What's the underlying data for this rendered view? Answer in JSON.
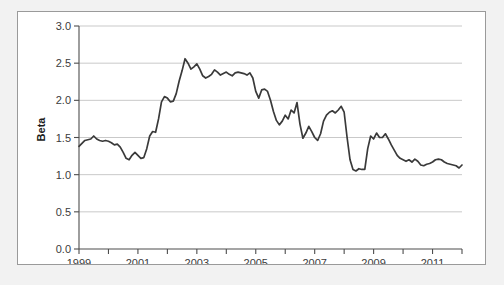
{
  "chart_data": {
    "type": "line",
    "title": "",
    "xlabel": "",
    "ylabel": "Beta",
    "xlim": [
      1999,
      2012
    ],
    "ylim": [
      0.0,
      3.0
    ],
    "grid": true,
    "legend": null,
    "ytick_labels": [
      "0.0",
      "0.5",
      "1.0",
      "1.5",
      "2.0",
      "2.5",
      "3.0"
    ],
    "ytick_values": [
      0.0,
      0.5,
      1.0,
      1.5,
      2.0,
      2.5,
      3.0
    ],
    "xtick_labels": [
      "1999",
      "2001",
      "2003",
      "2005",
      "2007",
      "2009",
      "2011"
    ],
    "xtick_values": [
      1999,
      2001,
      2003,
      2005,
      2007,
      2009,
      2011
    ],
    "xminor_ticks": [
      2000,
      2002,
      2004,
      2006,
      2008,
      2010,
      2012
    ],
    "line_color": "#3a3a3a",
    "series": [
      {
        "name": "Beta",
        "x": [
          1999.0,
          1999.1,
          1999.2,
          1999.3,
          1999.4,
          1999.5,
          1999.6,
          1999.7,
          1999.8,
          1999.9,
          2000.0,
          2000.1,
          2000.2,
          2000.3,
          2000.4,
          2000.5,
          2000.6,
          2000.7,
          2000.8,
          2000.9,
          2001.0,
          2001.1,
          2001.2,
          2001.3,
          2001.4,
          2001.5,
          2001.6,
          2001.7,
          2001.8,
          2001.9,
          2002.0,
          2002.1,
          2002.2,
          2002.3,
          2002.4,
          2002.5,
          2002.6,
          2002.7,
          2002.8,
          2002.9,
          2003.0,
          2003.1,
          2003.2,
          2003.3,
          2003.4,
          2003.5,
          2003.6,
          2003.7,
          2003.8,
          2003.9,
          2004.0,
          2004.1,
          2004.2,
          2004.3,
          2004.4,
          2004.5,
          2004.6,
          2004.7,
          2004.8,
          2004.9,
          2005.0,
          2005.1,
          2005.2,
          2005.3,
          2005.4,
          2005.5,
          2005.6,
          2005.7,
          2005.8,
          2005.9,
          2006.0,
          2006.1,
          2006.2,
          2006.3,
          2006.4,
          2006.5,
          2006.6,
          2006.7,
          2006.8,
          2006.9,
          2007.0,
          2007.1,
          2007.2,
          2007.3,
          2007.4,
          2007.5,
          2007.6,
          2007.7,
          2007.8,
          2007.9,
          2008.0,
          2008.1,
          2008.2,
          2008.3,
          2008.4,
          2008.5,
          2008.6,
          2008.7,
          2008.8,
          2008.9,
          2009.0,
          2009.1,
          2009.2,
          2009.3,
          2009.4,
          2009.5,
          2009.6,
          2009.7,
          2009.8,
          2009.9,
          2010.0,
          2010.1,
          2010.2,
          2010.3,
          2010.4,
          2010.5,
          2010.6,
          2010.7,
          2010.8,
          2010.9,
          2011.0,
          2011.1,
          2011.2,
          2011.3,
          2011.4,
          2011.5,
          2011.6,
          2011.7,
          2011.8,
          2011.9,
          2012.0
        ],
        "y": [
          1.38,
          1.42,
          1.46,
          1.47,
          1.48,
          1.52,
          1.48,
          1.46,
          1.45,
          1.46,
          1.45,
          1.43,
          1.4,
          1.41,
          1.37,
          1.3,
          1.22,
          1.2,
          1.26,
          1.3,
          1.26,
          1.22,
          1.23,
          1.35,
          1.52,
          1.58,
          1.57,
          1.75,
          1.98,
          2.05,
          2.03,
          1.98,
          1.99,
          2.09,
          2.26,
          2.4,
          2.56,
          2.5,
          2.42,
          2.45,
          2.49,
          2.42,
          2.33,
          2.3,
          2.32,
          2.35,
          2.41,
          2.38,
          2.34,
          2.36,
          2.38,
          2.35,
          2.33,
          2.37,
          2.38,
          2.37,
          2.36,
          2.34,
          2.37,
          2.3,
          2.12,
          2.03,
          2.14,
          2.15,
          2.12,
          2.0,
          1.85,
          1.73,
          1.67,
          1.72,
          1.8,
          1.75,
          1.87,
          1.83,
          1.97,
          1.68,
          1.49,
          1.56,
          1.65,
          1.58,
          1.5,
          1.46,
          1.55,
          1.72,
          1.8,
          1.84,
          1.86,
          1.83,
          1.87,
          1.92,
          1.84,
          1.5,
          1.2,
          1.07,
          1.05,
          1.08,
          1.07,
          1.07,
          1.35,
          1.52,
          1.48,
          1.56,
          1.5,
          1.5,
          1.55,
          1.48,
          1.4,
          1.33,
          1.26,
          1.22,
          1.2,
          1.18,
          1.2,
          1.17,
          1.21,
          1.18,
          1.13,
          1.12,
          1.14,
          1.15,
          1.17,
          1.2,
          1.21,
          1.2,
          1.17,
          1.15,
          1.14,
          1.13,
          1.12,
          1.09,
          1.13
        ]
      }
    ]
  }
}
